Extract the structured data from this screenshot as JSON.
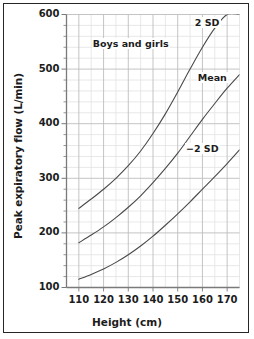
{
  "chart_data": {
    "type": "line",
    "title": "Boys and girls",
    "xlabel": "Height (cm)",
    "ylabel": "Peak expiratory flow (L/min)",
    "xlim": [
      105,
      175
    ],
    "ylim": [
      100,
      600
    ],
    "xticks": [
      110,
      120,
      130,
      140,
      150,
      160,
      170
    ],
    "yticks": [
      100,
      200,
      300,
      400,
      500,
      600
    ],
    "xtick_labels": [
      "110",
      "120",
      "130",
      "140",
      "150",
      "160",
      "170"
    ],
    "ytick_labels": [
      "100",
      "200",
      "300",
      "400",
      "500",
      "600"
    ],
    "x_minor_step": 5,
    "y_minor_step": 20,
    "grid": true,
    "legend": "inline-curve-labels",
    "x": [
      110,
      115,
      120,
      125,
      130,
      135,
      140,
      145,
      150,
      155,
      160,
      165,
      170,
      175
    ],
    "series": [
      {
        "name": "2 SD",
        "label": "2 SD",
        "values": [
          245,
          262,
          280,
          300,
          323,
          350,
          382,
          418,
          458,
          500,
          540,
          575,
          600,
          600
        ]
      },
      {
        "name": "Mean",
        "label": "Mean",
        "values": [
          182,
          196,
          211,
          228,
          247,
          268,
          292,
          318,
          346,
          377,
          408,
          437,
          465,
          490
        ]
      },
      {
        "name": "-2 SD",
        "label": "−2 SD",
        "values": [
          115,
          124,
          134,
          146,
          160,
          176,
          194,
          214,
          235,
          257,
          280,
          303,
          327,
          352
        ]
      }
    ],
    "annotations": [
      {
        "text": "Boys and girls",
        "x": 131,
        "y": 545
      },
      {
        "text": "2 SD",
        "x": 162,
        "y": 583
      },
      {
        "text": "Mean",
        "x": 164,
        "y": 482
      },
      {
        "text": "−2 SD",
        "x": 160,
        "y": 352
      }
    ],
    "colors": {
      "curve": "#4a4a4a",
      "grid_minor": "#e2e2e2",
      "grid_major": "#bdbdbd",
      "axis": "#7a7a7a",
      "text": "#1c1c1c",
      "frame": "#262626",
      "background": "#ffffff"
    }
  }
}
